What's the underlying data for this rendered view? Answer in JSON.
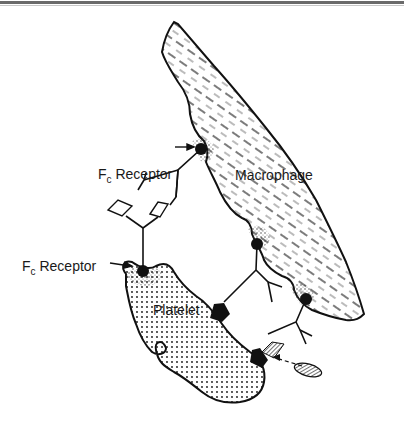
{
  "figure": {
    "labels": {
      "fc_receptor_top": {
        "main": "F",
        "sub": "c",
        "rest": " Receptor"
      },
      "fc_receptor_bottom": {
        "main": "F",
        "sub": "c",
        "rest": " Receptor"
      },
      "macrophage": "Macrophage",
      "platelet": "Platelet"
    },
    "colors": {
      "ink": "#111111",
      "background": "#ffffff",
      "rule": "#6a6a6a"
    }
  }
}
